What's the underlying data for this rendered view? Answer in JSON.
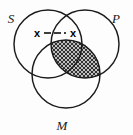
{
  "figure": {
    "kind": "three-circle-venn-diagram",
    "width": 133,
    "height": 135,
    "background_color": "#fdfdfd",
    "stroke_color": "#1b1b1b",
    "shade_color": "#2a2a2a"
  },
  "sets": [
    {
      "id": "S",
      "label": "S",
      "cx": 48,
      "cy": 44,
      "r": 34,
      "label_x": 11,
      "label_y": 23
    },
    {
      "id": "P",
      "label": "P",
      "cx": 85,
      "cy": 44,
      "r": 34,
      "label_x": 116,
      "label_y": 23
    },
    {
      "id": "M",
      "label": "M",
      "cx": 66,
      "cy": 74,
      "r": 34,
      "label_x": 62,
      "label_y": 130
    }
  ],
  "shaded_regions": [
    {
      "id": "P-and-M",
      "description": "P intersect M"
    },
    {
      "id": "S-and-P-and-M",
      "description": "S intersect P intersect M"
    }
  ],
  "annotations": {
    "x_bar": {
      "left_label": "x",
      "right_label": "x",
      "left_x": 37,
      "right_x": 73,
      "y": 34,
      "bar_from_x": 44,
      "bar_to_x": 66,
      "bar_y": 33,
      "dash_pattern": "7,3"
    }
  }
}
